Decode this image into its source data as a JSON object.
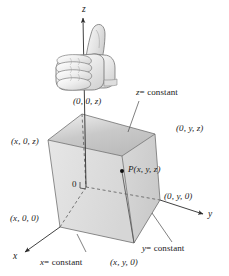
{
  "figure": {
    "type": "math-diagram",
    "background": "#ffffff",
    "ink_color": "#1a1a1a"
  },
  "axes": [
    {
      "name": "z-axis",
      "label": "z",
      "direction": "up"
    },
    {
      "name": "y-axis",
      "label": "y",
      "direction": "right"
    },
    {
      "name": "x-axis",
      "label": "x",
      "direction": "lower-left"
    }
  ],
  "origin": {
    "label": "0",
    "name": "origin-label"
  },
  "point": {
    "label": "P(x, y, z)",
    "name": "point-p"
  },
  "vertex_labels": [
    {
      "name": "vertex-0-0-z",
      "text": "(0, 0, z)"
    },
    {
      "name": "vertex-0-y-z",
      "text": "(0, y, z)"
    },
    {
      "name": "vertex-x-0-z",
      "text": "(x, 0, z)"
    },
    {
      "name": "vertex-0-y-0",
      "text": "(0, y, 0)"
    },
    {
      "name": "vertex-x-0-0",
      "text": "(x, 0, 0)"
    },
    {
      "name": "vertex-x-y-0",
      "text": "(x, y, 0)"
    }
  ],
  "plane_labels": [
    {
      "name": "plane-z-constant",
      "var": "z",
      "text": "= constant",
      "full": "z = constant"
    },
    {
      "name": "plane-y-constant",
      "var": "y",
      "text": "= constant",
      "full": "y = constant"
    },
    {
      "name": "plane-x-constant",
      "var": "x",
      "text": "= constant",
      "full": "x = constant"
    }
  ],
  "hand": {
    "name": "right-hand-thumb-up-icon",
    "description": "right hand with thumb pointing up along z-axis"
  },
  "colors": {
    "top_face": "#c4c4c4",
    "left_face": "#dcdcdc",
    "right_face": "#d2d2d2",
    "bottom_face": "#ebebeb",
    "line": "#333333",
    "dashed": "#555555"
  }
}
